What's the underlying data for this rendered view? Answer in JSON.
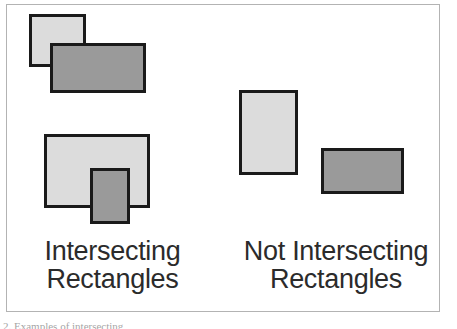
{
  "figure": {
    "background_color": "#ffffff",
    "frame_color": "#b3b3b3",
    "footnote": "2. Examples of intersecting"
  },
  "palette": {
    "light_fill": "#dcdcdc",
    "dark_fill": "#9a9a9a",
    "outline": "#1a1a1a",
    "text": "#2b2b2b"
  },
  "groups": [
    {
      "id": "intersecting",
      "caption": "Intersecting\nRectangles",
      "caption_line_1": "Intersecting",
      "caption_line_2": "Rectangles",
      "pairs": [
        {
          "id": "pair-1",
          "shapes": [
            {
              "name": "light-rectangle",
              "fill": "light",
              "x": 29,
              "y": 14,
              "w": 57,
              "h": 53
            },
            {
              "name": "dark-rectangle",
              "fill": "dark",
              "x": 50,
              "y": 43,
              "w": 96,
              "h": 50
            }
          ]
        },
        {
          "id": "pair-2",
          "shapes": [
            {
              "name": "light-rectangle",
              "fill": "light",
              "x": 44,
              "y": 134,
              "w": 106,
              "h": 74
            },
            {
              "name": "dark-rectangle",
              "fill": "dark",
              "x": 90,
              "y": 168,
              "w": 40,
              "h": 56
            }
          ]
        }
      ]
    },
    {
      "id": "not-intersecting",
      "caption": "Not Intersecting\nRectangles",
      "caption_line_1": "Not Intersecting",
      "caption_line_2": "Rectangles",
      "pairs": [
        {
          "id": "pair-3",
          "shapes": [
            {
              "name": "light-rectangle",
              "fill": "light",
              "x": 239,
              "y": 90,
              "w": 59,
              "h": 85
            },
            {
              "name": "dark-rectangle",
              "fill": "dark",
              "x": 321,
              "y": 148,
              "w": 83,
              "h": 46
            }
          ]
        }
      ]
    }
  ]
}
